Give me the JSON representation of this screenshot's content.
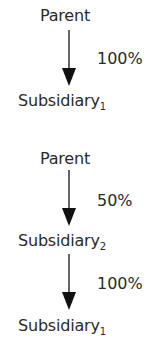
{
  "diagrams": [
    {
      "top": {
        "name": "Parent"
      },
      "links": [
        {
          "percentage": "100%"
        }
      ],
      "nodes": [
        {
          "name": "Subsidiary",
          "subscript": "1"
        }
      ]
    },
    {
      "top": {
        "name": "Parent"
      },
      "links": [
        {
          "percentage": "50%"
        },
        {
          "percentage": "100%"
        }
      ],
      "nodes": [
        {
          "name": "Subsidiary",
          "subscript": "2"
        },
        {
          "name": "Subsidiary",
          "subscript": "1"
        }
      ]
    }
  ],
  "colors": {
    "text": "#2a2a2a",
    "arrow": "#111111"
  }
}
